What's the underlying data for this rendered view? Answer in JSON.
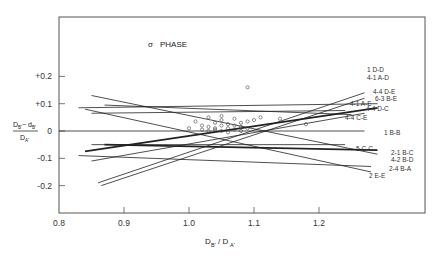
{
  "chart_data": {
    "type": "line",
    "title": "σ PHASE",
    "xlabel": "D_B' / D_A'",
    "ylabel": "(D_B' − d_B') / D_A'",
    "xlim": [
      0.8,
      1.29
    ],
    "ylim": [
      -0.3,
      0.32
    ],
    "grid": false,
    "x_ticks": [
      "0.8",
      "0.9",
      "1.0",
      "1.1",
      "1.2"
    ],
    "y_ticks": [
      "+0.2",
      "+0.1",
      "0",
      "-0.1",
      "-0.2"
    ],
    "series": [
      {
        "name": "1 D-D",
        "x": [
          0.86,
          1.27
        ],
        "y": [
          -0.19,
          0.14
        ],
        "weight": "thin"
      },
      {
        "name": "4-1 A-D",
        "x": [
          0.865,
          1.27
        ],
        "y": [
          -0.2,
          0.12
        ],
        "weight": "thin"
      },
      {
        "name": "4-4 D-E",
        "x": [
          0.83,
          1.29
        ],
        "y": [
          0.085,
          0.1
        ],
        "weight": "thin"
      },
      {
        "name": "6-3 B-E",
        "x": [
          0.84,
          1.29
        ],
        "y": [
          -0.075,
          0.085
        ],
        "weight": "thick"
      },
      {
        "name": "4-1 A-E",
        "x": [
          0.85,
          1.24
        ],
        "y": [
          0.065,
          0.075
        ],
        "weight": "thin"
      },
      {
        "name": "4-4 D-C",
        "x": [
          0.85,
          1.27
        ],
        "y": [
          -0.11,
          0.065
        ],
        "weight": "thin"
      },
      {
        "name": "4-4 C-E",
        "x": [
          0.87,
          1.25
        ],
        "y": [
          0.095,
          0.06
        ],
        "weight": "thin"
      },
      {
        "name": "1 B-B",
        "x": [
          0.8,
          1.27
        ],
        "y": [
          0.0,
          0.0
        ],
        "weight": "thin"
      },
      {
        "name": "5 C-C",
        "x": [
          0.85,
          1.24
        ],
        "y": [
          -0.05,
          -0.05
        ],
        "weight": "thin"
      },
      {
        "name": "2-1 B-C",
        "x": [
          0.87,
          1.29
        ],
        "y": [
          -0.05,
          -0.07
        ],
        "weight": "thick"
      },
      {
        "name": "4-2 B-D",
        "x": [
          0.85,
          1.29
        ],
        "y": [
          0.13,
          -0.085
        ],
        "weight": "thin"
      },
      {
        "name": "2-4 B-A",
        "x": [
          0.83,
          1.28
        ],
        "y": [
          -0.09,
          -0.13
        ],
        "weight": "thin"
      },
      {
        "name": "2 E-E",
        "x": [
          0.84,
          1.28
        ],
        "y": [
          0.08,
          -0.15
        ],
        "weight": "thin"
      }
    ],
    "scatter": {
      "marker": "open-circle",
      "points": [
        [
          1.09,
          0.16
        ],
        [
          1.03,
          0.05
        ],
        [
          1.05,
          0.04
        ],
        [
          1.07,
          0.045
        ],
        [
          1.04,
          0.03
        ],
        [
          1.01,
          0.035
        ],
        [
          1.02,
          0.02
        ],
        [
          1.03,
          0.015
        ],
        [
          1.04,
          0.01
        ],
        [
          1.05,
          0.02
        ],
        [
          1.06,
          0.025
        ],
        [
          1.07,
          0.02
        ],
        [
          1.08,
          0.03
        ],
        [
          1.09,
          0.035
        ],
        [
          1.1,
          0.04
        ],
        [
          1.02,
          0.005
        ],
        [
          1.03,
          0.0
        ],
        [
          1.04,
          0.005
        ],
        [
          1.05,
          0.0
        ],
        [
          1.06,
          0.01
        ],
        [
          1.07,
          0.005
        ],
        [
          1.08,
          0.015
        ],
        [
          1.09,
          0.01
        ],
        [
          1.06,
          -0.005
        ],
        [
          1.08,
          0.0
        ],
        [
          1.14,
          0.045
        ],
        [
          1.18,
          0.025
        ],
        [
          1.11,
          0.05
        ],
        [
          1.0,
          0.01
        ],
        [
          1.05,
          0.055
        ]
      ]
    }
  },
  "labels": {
    "title_sigma": "σ",
    "title_text": "PHASE",
    "x_axis": {
      "main": "D",
      "sub1": "B'",
      "slash": "/ D",
      "sub2": "A'"
    },
    "y_axis": {
      "num_main": "D",
      "num_sub1": "B'",
      "minus": "− d",
      "num_sub2": "B'",
      "den_main": "D",
      "den_sub": "A'"
    }
  }
}
